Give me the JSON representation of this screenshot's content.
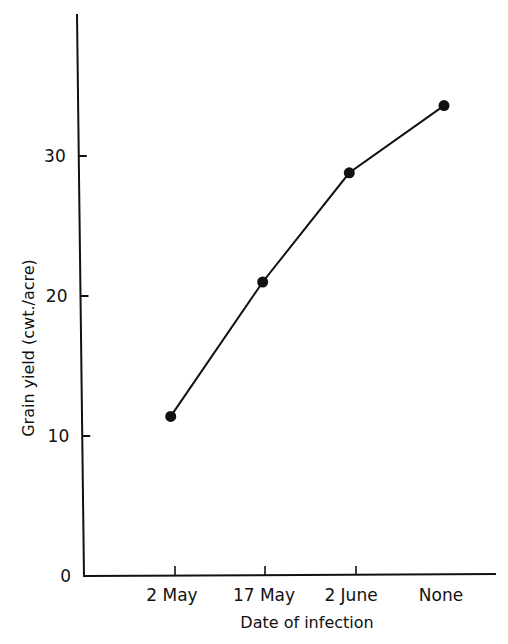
{
  "chart_data": {
    "type": "line",
    "title": "",
    "xlabel": "Date of infection",
    "ylabel": "Grain yield (cwt./acre)",
    "categories": [
      "2 May",
      "17 May",
      "2 June",
      "None"
    ],
    "series": [
      {
        "name": "Grain yield",
        "values": [
          11.4,
          21.0,
          28.8,
          33.6
        ]
      }
    ],
    "yticks": [
      0,
      10,
      20,
      30
    ],
    "ylim": [
      0,
      40
    ],
    "grid": false,
    "legend": null,
    "marker": "filled-circle",
    "line_color": "#111111"
  }
}
